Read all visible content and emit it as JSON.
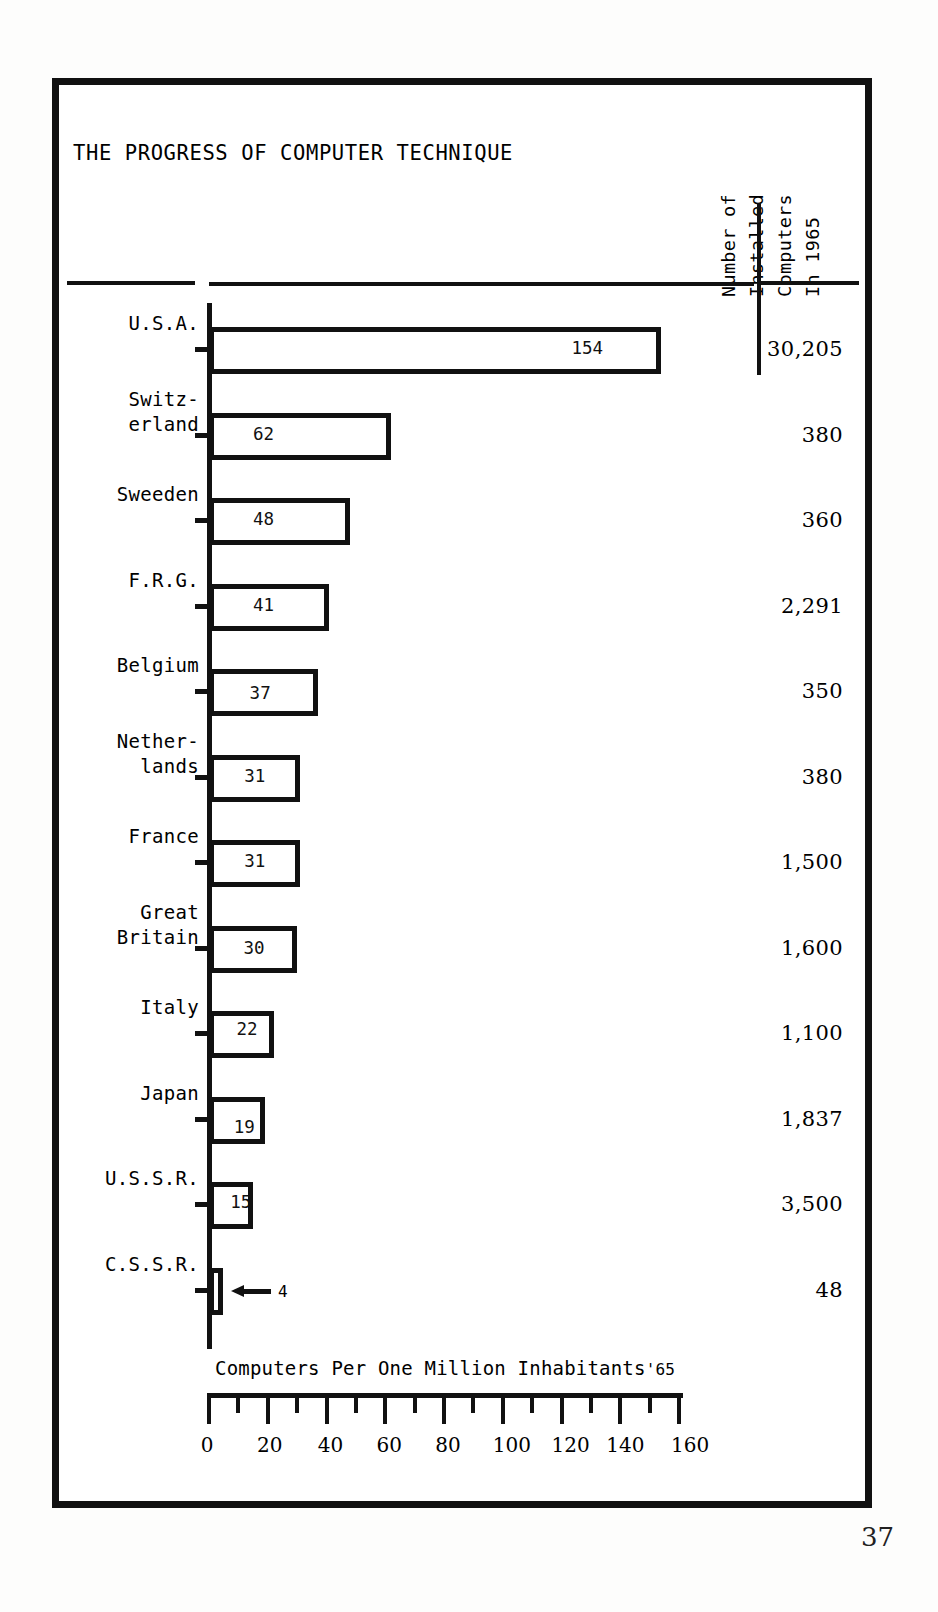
{
  "document": {
    "page_number": "37"
  },
  "header": {
    "title": "THE PROGRESS OF COMPUTER TECHNIQUE",
    "right_column_header_lines": [
      "Number of",
      "Installed",
      "Computers",
      "In 1965"
    ]
  },
  "axis": {
    "x_label": "Computers Per One Million Inhabitants",
    "x_label_suffix": "'65",
    "tick_labels": [
      "0",
      "20",
      "40",
      "60",
      "80",
      "100",
      "120",
      "140",
      "160"
    ],
    "tick_values": [
      0,
      20,
      40,
      60,
      80,
      100,
      120,
      140,
      160
    ],
    "minor_step": 10
  },
  "chart_data": {
    "type": "bar",
    "orientation": "horizontal",
    "title": "THE PROGRESS OF COMPUTER TECHNIQUE",
    "xlabel": "Computers Per One Million Inhabitants '65",
    "ylabel": "",
    "xlim": [
      0,
      160
    ],
    "grid": false,
    "legend": null,
    "categories": [
      "U.S.A.",
      "Switz-\nerland",
      "Sweeden",
      "F.R.G.",
      "Belgium",
      "Nether-\nlands",
      "France",
      "Great\nBritain",
      "Italy",
      "Japan",
      "U.S.S.R.",
      "C.S.S.R."
    ],
    "values": [
      154,
      62,
      48,
      41,
      37,
      31,
      31,
      30,
      22,
      19,
      15,
      4
    ],
    "value_labels": [
      "154",
      "62",
      "48",
      "41",
      "37",
      "31",
      "31",
      "30",
      "22",
      "19",
      "15",
      "4"
    ],
    "annotations": [
      {
        "category": "C.S.S.R.",
        "type": "arrow-callout",
        "text": "4",
        "note": "left-pointing arrow labelling the very short bar"
      }
    ],
    "secondary_series": {
      "name": "Number of Installed Computers In 1965",
      "values": [
        "30,205",
        "380",
        "360",
        "2,291",
        "350",
        "380",
        "1,500",
        "1,600",
        "1,100",
        "1,837",
        "3,500",
        "48"
      ]
    }
  },
  "rows": [
    {
      "label": "U.S.A.",
      "label_lines": [
        "U.S.A."
      ],
      "value": 154,
      "value_label": "154",
      "installed": "30,205"
    },
    {
      "label": "Switzerland",
      "label_lines": [
        "Switz-",
        "erland"
      ],
      "value": 62,
      "value_label": "62",
      "installed": "380"
    },
    {
      "label": "Sweeden",
      "label_lines": [
        "Sweeden"
      ],
      "value": 48,
      "value_label": "48",
      "installed": "360"
    },
    {
      "label": "F.R.G.",
      "label_lines": [
        "F.R.G."
      ],
      "value": 41,
      "value_label": "41",
      "installed": "2,291"
    },
    {
      "label": "Belgium",
      "label_lines": [
        "Belgium"
      ],
      "value": 37,
      "value_label": "37",
      "installed": "350"
    },
    {
      "label": "Netherlands",
      "label_lines": [
        "Nether-",
        "lands"
      ],
      "value": 31,
      "value_label": "31",
      "installed": "380"
    },
    {
      "label": "France",
      "label_lines": [
        "France"
      ],
      "value": 31,
      "value_label": "31",
      "installed": "1,500"
    },
    {
      "label": "Great Britain",
      "label_lines": [
        "Great",
        "Britain"
      ],
      "value": 30,
      "value_label": "30",
      "installed": "1,600"
    },
    {
      "label": "Italy",
      "label_lines": [
        "Italy"
      ],
      "value": 22,
      "value_label": "22",
      "installed": "1,100"
    },
    {
      "label": "Japan",
      "label_lines": [
        "Japan"
      ],
      "value": 19,
      "value_label": "19",
      "installed": "1,837"
    },
    {
      "label": "U.S.S.R.",
      "label_lines": [
        "U.S.S.R."
      ],
      "value": 15,
      "value_label": "15",
      "installed": "3,500"
    },
    {
      "label": "C.S.S.R.",
      "label_lines": [
        "C.S.S.R."
      ],
      "value": 4,
      "value_label": "4",
      "installed": "48"
    }
  ]
}
